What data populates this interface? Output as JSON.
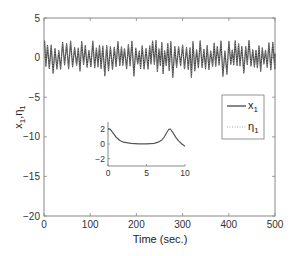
{
  "chart_data": {
    "type": "line",
    "title": "",
    "xlabel": "Time (sec.)",
    "ylabel": "x1, η1",
    "ylabel_parts": {
      "a": "x",
      "a_sub": "1",
      "sep": ",",
      "b": "η",
      "b_sub": "1"
    },
    "xlim": [
      0,
      500
    ],
    "ylim": [
      -20,
      5
    ],
    "xticks": [
      0,
      100,
      200,
      300,
      400,
      500
    ],
    "yticks": [
      5,
      0,
      -5,
      -10,
      -15,
      -20
    ],
    "xtick_labels": [
      "0",
      "100",
      "200",
      "300",
      "400",
      "500"
    ],
    "ytick_labels": [
      "5",
      "0",
      "−5",
      "−10",
      "−15",
      "−20"
    ],
    "grid": false,
    "legend": {
      "position": "right-middle",
      "entries": [
        {
          "label": "x",
          "sub": "1",
          "style": "solid",
          "color": "#444444"
        },
        {
          "label": "η",
          "sub": "1",
          "style": "dotted",
          "color": "#9a9a9a"
        }
      ]
    },
    "series": [
      {
        "name": "x1",
        "style": "solid",
        "color": "#444444",
        "description": "Chaotic oscillation around 0 with approx. period ~8 sec, amplitude roughly between -2.5 and +2 over the full 0–500 s window",
        "y_range_approx": [
          -2.5,
          2.2
        ],
        "mean_approx": 0
      },
      {
        "name": "η1",
        "style": "dotted",
        "color": "#9a9a9a",
        "description": "Overlaps x1 (synchronized), not separately distinguishable",
        "y_range_approx": [
          -2.5,
          2.2
        ]
      }
    ],
    "inset": {
      "xlim": [
        0,
        10
      ],
      "ylim": [
        -3,
        3
      ],
      "xticks": [
        0,
        5,
        10
      ],
      "yticks": [
        2,
        0,
        -2
      ],
      "xtick_labels": [
        "0",
        "5",
        "10"
      ],
      "ytick_labels": [
        "2",
        "0",
        "−2"
      ],
      "series": {
        "name": "x1 (zoom 0–10 s)",
        "x": [
          0,
          0.3,
          0.6,
          1,
          1.5,
          2,
          3,
          4,
          5,
          6,
          6.5,
          7,
          7.3,
          7.6,
          7.9,
          8.1,
          8.4,
          8.8,
          9.2,
          9.6,
          10
        ],
        "y": [
          2.1,
          2.0,
          1.6,
          1.0,
          0.5,
          0.25,
          0.08,
          0.03,
          0.03,
          0.1,
          0.25,
          0.55,
          0.95,
          1.5,
          2.0,
          2.05,
          1.6,
          0.9,
          0.4,
          0.0,
          -0.3
        ]
      }
    }
  }
}
